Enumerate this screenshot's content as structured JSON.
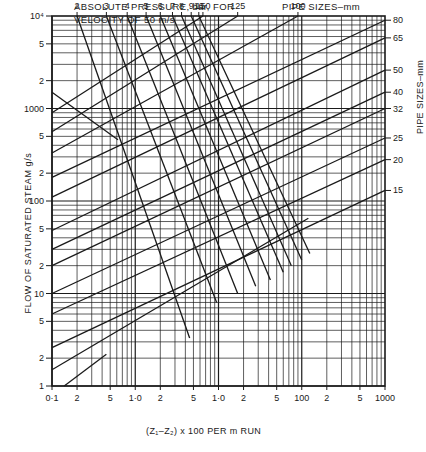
{
  "chart_data": {
    "type": "line",
    "title": "ABSOLUTE PRESSURE, bar, FOR VELOCITY OF 50 m/s",
    "top_pipe_label": "PIPE SIZES–mm",
    "right_pipe_label": "PIPE SIZES–mm",
    "xlabel": "(Z1–Z2) x 100 PER m RUN",
    "ylabel": "FLOW OF SATURATED STEAM g/s",
    "xscale": "log",
    "yscale": "log",
    "xlim": [
      0.1,
      1000
    ],
    "ylim": [
      1,
      10000
    ],
    "grid": true,
    "x_ticks": [
      {
        "v": 0.1,
        "label": "0·1"
      },
      {
        "v": 0.2,
        "label": "2"
      },
      {
        "v": 0.5,
        "label": "5"
      },
      {
        "v": 1,
        "label": "1·0"
      },
      {
        "v": 2,
        "label": "2"
      },
      {
        "v": 5,
        "label": "5"
      },
      {
        "v": 10,
        "label": "1·0"
      },
      {
        "v": 20,
        "label": "2"
      },
      {
        "v": 50,
        "label": "5"
      },
      {
        "v": 100,
        "label": "100"
      },
      {
        "v": 200,
        "label": "2"
      },
      {
        "v": 500,
        "label": "5"
      },
      {
        "v": 1000,
        "label": "1000"
      }
    ],
    "y_ticks": [
      {
        "v": 10000,
        "label": "10⁴"
      },
      {
        "v": 5000,
        "label": "5"
      },
      {
        "v": 2000,
        "label": "2"
      },
      {
        "v": 1000,
        "label": "1000"
      },
      {
        "v": 500,
        "label": "5"
      },
      {
        "v": 200,
        "label": "2"
      },
      {
        "v": 100,
        "label": "100"
      },
      {
        "v": 50,
        "label": "5"
      },
      {
        "v": 20,
        "label": "2"
      },
      {
        "v": 10,
        "label": "10"
      },
      {
        "v": 5,
        "label": "5"
      },
      {
        "v": 2,
        "label": "2"
      },
      {
        "v": 1,
        "label": "1"
      }
    ],
    "pipe_size_series": [
      {
        "name": "150",
        "label_pos": "top",
        "points": [
          [
            0.1,
            900
          ],
          [
            6.5,
            10000
          ]
        ]
      },
      {
        "name": "125",
        "label_pos": "top",
        "points": [
          [
            0.1,
            560
          ],
          [
            17,
            10000
          ]
        ]
      },
      {
        "name": "100",
        "label_pos": "top",
        "points": [
          [
            0.1,
            330
          ],
          [
            90,
            10000
          ]
        ]
      },
      {
        "name": "80",
        "label_pos": "right",
        "points": [
          [
            0.1,
            180
          ],
          [
            1000,
            9000
          ]
        ]
      },
      {
        "name": "65",
        "label_pos": "right",
        "points": [
          [
            0.1,
            110
          ],
          [
            1000,
            5800
          ]
        ]
      },
      {
        "name": "50",
        "label_pos": "right",
        "points": [
          [
            0.1,
            48
          ],
          [
            1000,
            2600
          ]
        ]
      },
      {
        "name": "40",
        "label_pos": "right",
        "points": [
          [
            0.1,
            30
          ],
          [
            1000,
            1500
          ]
        ]
      },
      {
        "name": "32",
        "label_pos": "right",
        "points": [
          [
            0.1,
            20
          ],
          [
            1000,
            1000
          ]
        ]
      },
      {
        "name": "25",
        "label_pos": "right",
        "points": [
          [
            0.1,
            10
          ],
          [
            1000,
            480
          ]
        ]
      },
      {
        "name": "20",
        "label_pos": "right",
        "points": [
          [
            0.1,
            6
          ],
          [
            1000,
            280
          ]
        ]
      },
      {
        "name": "15",
        "label_pos": "right",
        "points": [
          [
            0.1,
            2.6
          ],
          [
            1000,
            130
          ]
        ]
      },
      {
        "name": "",
        "label_pos": "none",
        "points": [
          [
            0.1,
            1.5
          ],
          [
            120,
            65
          ]
        ]
      },
      {
        "name": "",
        "label_pos": "none",
        "points": [
          [
            0.14,
            1
          ],
          [
            0.45,
            2.2
          ]
        ]
      }
    ],
    "pressure_series": [
      {
        "name": "2",
        "points": [
          [
            0.2,
            10000
          ],
          [
            4.5,
            3.3
          ]
        ]
      },
      {
        "name": "3",
        "points": [
          [
            0.45,
            10000
          ],
          [
            9.5,
            8
          ]
        ]
      },
      {
        "name": "4",
        "points": [
          [
            0.8,
            10000
          ],
          [
            17,
            10
          ]
        ]
      },
      {
        "name": "5",
        "points": [
          [
            1.35,
            10000
          ],
          [
            28,
            12
          ]
        ]
      },
      {
        "name": "6",
        "points": [
          [
            2.0,
            10000
          ],
          [
            42,
            14
          ]
        ]
      },
      {
        "name": "7",
        "points": [
          [
            2.8,
            10000
          ],
          [
            60,
            17
          ]
        ]
      },
      {
        "name": "8",
        "points": [
          [
            3.6,
            10000
          ],
          [
            75,
            20
          ]
        ]
      },
      {
        "name": "9",
        "points": [
          [
            4.7,
            10000
          ],
          [
            100,
            23
          ]
        ]
      },
      {
        "name": "10",
        "points": [
          [
            5.8,
            10000
          ],
          [
            125,
            27
          ]
        ]
      },
      {
        "name": "",
        "points": [
          [
            0.1,
            1500
          ],
          [
            0.62,
            460
          ]
        ]
      }
    ]
  },
  "labels": {
    "title_line1": "ABSOLUTE PRESSURE, bar, FOR",
    "title_line2": "VELOCITY OF 50 m/s",
    "top_pipe_label": "PIPE SIZES–mm",
    "right_pipe_label": "PIPE SIZES–mm",
    "xlabel": "(Z₁–Z₂) x 100 PER m RUN",
    "ylabel": "FLOW OF SATURATED STEAM g/s"
  },
  "colors": {
    "ink": "#1a1a1a",
    "grid": "#2a2a2a",
    "background": "#ffffff"
  }
}
